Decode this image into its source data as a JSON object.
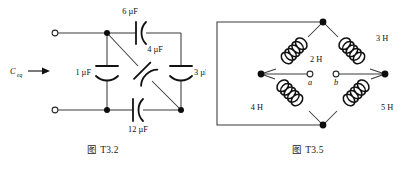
{
  "page": {
    "background": "#ffffff",
    "width": 411,
    "height": 171,
    "ink_color": "#111111",
    "wire_color": "#3a3a3a"
  },
  "figures": [
    {
      "id": "fig-t3-2",
      "caption": "图 T3.2",
      "type": "capacitor-network",
      "input_label": "C",
      "input_label_sub": "eq",
      "components": [
        {
          "name": "capacitor-6uf",
          "label": "6 µF",
          "value": 6,
          "unit": "µF",
          "position": "top-branch"
        },
        {
          "name": "capacitor-4uf",
          "label": "4 µF",
          "value": 4,
          "unit": "µF",
          "position": "diagonal-branch"
        },
        {
          "name": "capacitor-1uf",
          "label": "1 µF",
          "value": 1,
          "unit": "µF",
          "position": "left-shunt"
        },
        {
          "name": "capacitor-3uf",
          "label": "3 µF",
          "value": 3,
          "unit": "µF",
          "position": "right-shunt"
        },
        {
          "name": "capacitor-12uf",
          "label": "12 µF",
          "value": 12,
          "unit": "µF",
          "position": "bottom-branch"
        }
      ],
      "terminals": [
        {
          "name": "terminal-top-left",
          "style": "open-circle"
        },
        {
          "name": "terminal-bottom-left",
          "style": "open-circle"
        }
      ]
    },
    {
      "id": "fig-t3-5",
      "caption": "图 T3.5",
      "type": "inductor-bridge",
      "components": [
        {
          "name": "inductor-2h",
          "label": "2 H",
          "value": 2,
          "unit": "H",
          "position": "top-left-arm"
        },
        {
          "name": "inductor-3h",
          "label": "3 H",
          "value": 3,
          "unit": "H",
          "position": "top-right-arm"
        },
        {
          "name": "inductor-4h",
          "label": "4 H",
          "value": 4,
          "unit": "H",
          "position": "bottom-left-arm"
        },
        {
          "name": "inductor-5h",
          "label": "5 H",
          "value": 5,
          "unit": "H",
          "position": "bottom-right-arm"
        }
      ],
      "terminals": [
        {
          "name": "terminal-a",
          "label": "a",
          "style": "open-circle"
        },
        {
          "name": "terminal-b",
          "label": "b",
          "style": "open-circle"
        }
      ]
    }
  ],
  "labels": {
    "ceq": "C",
    "ceq_sub": "eq",
    "c6": "6 µF",
    "c4": "4 µF",
    "c1": "1 µF",
    "c3": "3 µF",
    "c12": "12 µF",
    "l2": "2 H",
    "l3": "3 H",
    "l4": "4 H",
    "l5": "5 H",
    "term_a": "a",
    "term_b": "b",
    "caption_left": "图 T3.2",
    "caption_right": "图 T3.5"
  }
}
